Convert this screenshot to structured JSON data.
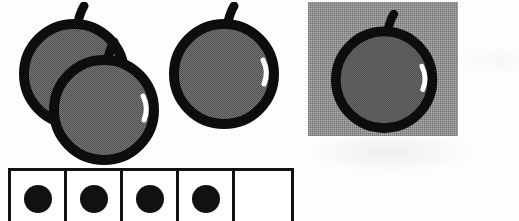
{
  "worksheet": {
    "title": "Counting apples worksheet",
    "description": "Scanned black-and-white worksheet illustration showing apples and a row of counting boxes.",
    "background_color": "#fdfdfd"
  },
  "colors": {
    "ink": "#111111",
    "apple_fill": "#6e6e6e",
    "panel_gray": "#9a9a9a",
    "highlight": "#ffffff",
    "paper": "#ffffff"
  },
  "apple_group_left": {
    "name": "left apple cluster",
    "count": 3,
    "apples": [
      {
        "id": "apple-back-left",
        "label": "apple",
        "overlap": "behind",
        "size": 112,
        "highlight": false
      },
      {
        "id": "apple-front-left",
        "label": "apple",
        "overlap": "front",
        "size": 112,
        "highlight": true
      },
      {
        "id": "apple-right",
        "label": "apple",
        "overlap": "none",
        "size": 112,
        "highlight": true
      }
    ]
  },
  "apple_panel_right": {
    "name": "apple on gray panel",
    "count": 1,
    "panel": {
      "label": "gray square background",
      "width": 150,
      "height": 134,
      "color": "#9a9a9a"
    },
    "apple": {
      "id": "apple-panel",
      "label": "apple",
      "size": 108,
      "highlight": true
    }
  },
  "count_grid": {
    "name": "counting boxes row",
    "total_cells": 5,
    "filled_count": 4,
    "cells": [
      {
        "index": 1,
        "filled": true,
        "marker": "dot"
      },
      {
        "index": 2,
        "filled": true,
        "marker": "dot"
      },
      {
        "index": 3,
        "filled": true,
        "marker": "dot"
      },
      {
        "index": 4,
        "filled": true,
        "marker": "dot"
      },
      {
        "index": 5,
        "filled": false,
        "marker": "empty"
      }
    ],
    "cropped": true
  }
}
